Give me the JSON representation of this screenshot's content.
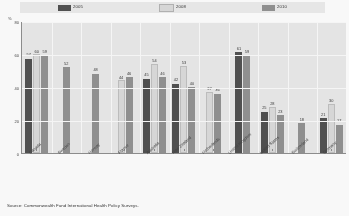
{
  "chart_data": {
    "type": "bar",
    "title": "",
    "xlabel": "",
    "ylabel": "%",
    "ylim": [
      0,
      80
    ],
    "yticks": [
      0,
      20,
      40,
      60,
      80
    ],
    "grid": true,
    "legend_position": "top",
    "categories": [
      "Canada",
      "Sweden",
      "Norway",
      "France",
      "Australia",
      "New Zealand",
      "Netherlands",
      "United Kingdom",
      "United States",
      "Switzerland",
      "Germany"
    ],
    "series": [
      {
        "name": "2005",
        "color": "#4a4a4a",
        "values": [
          57,
          null,
          null,
          null,
          45,
          42,
          null,
          61,
          25,
          null,
          21
        ]
      },
      {
        "name": "2008",
        "color": "#d9d9d9",
        "values": [
          60,
          null,
          null,
          44,
          54,
          53,
          37,
          null,
          28,
          null,
          30
        ]
      },
      {
        "name": "2010",
        "color": "#8d8d8d",
        "values": [
          59,
          52,
          48,
          46,
          46,
          40,
          36,
          59,
          23,
          18,
          17
        ]
      }
    ]
  },
  "legend": {
    "items": [
      {
        "label": "2005",
        "color": "#4a4a4a"
      },
      {
        "label": "2008",
        "color": "#d9d9d9"
      },
      {
        "label": "2010",
        "color": "#8d8d8d"
      }
    ]
  },
  "axis": {
    "unit_label": "%",
    "ticks": [
      "80",
      "60",
      "40",
      "20",
      "0"
    ]
  },
  "source": {
    "text": "Source:  Commonwealth Fund International Health Policy Surveys."
  }
}
